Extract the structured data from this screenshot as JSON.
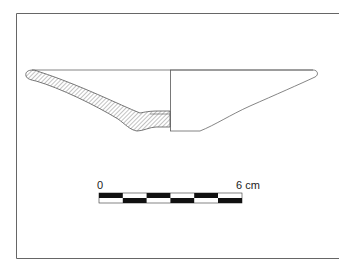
{
  "figure": {
    "type": "pottery-profile-drawing"
  },
  "scale_bar": {
    "start_label": "0",
    "end_label": "6 cm",
    "segments": 6,
    "unit": "cm"
  },
  "colors": {
    "line": "#555555",
    "hatch": "#777777",
    "scale_black": "#111111",
    "frame": "#666666"
  }
}
